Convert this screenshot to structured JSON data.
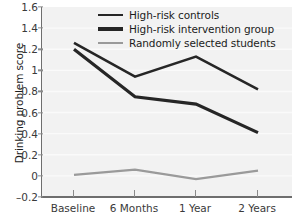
{
  "chart_data": {
    "type": "line",
    "title": "",
    "xlabel": "",
    "ylabel": "Drinking problem score",
    "categories": [
      "Baseline",
      "6 Months",
      "1 Year",
      "2 Years"
    ],
    "ylim": [
      -0.2,
      1.6
    ],
    "yticks": [
      "1.6",
      "1.4",
      "1.2",
      "1",
      "0.8",
      "0.6",
      "0.4",
      "0.2",
      "0",
      "–0.2"
    ],
    "ytick_values": [
      1.6,
      1.4,
      1.2,
      1.0,
      0.8,
      0.6,
      0.4,
      0.2,
      0,
      -0.2
    ],
    "grid": "horizontal-light",
    "legend_position": "top-center",
    "series": [
      {
        "name": "High-risk controls",
        "values": [
          1.26,
          0.94,
          1.13,
          0.82
        ],
        "color": "#262626",
        "width": 2.6
      },
      {
        "name": "High-risk intervention group",
        "values": [
          1.2,
          0.75,
          0.68,
          0.41
        ],
        "color": "#262626",
        "width": 3.2
      },
      {
        "name": "Randomly selected students",
        "values": [
          0.01,
          0.06,
          -0.03,
          0.05
        ],
        "color": "#9a9a9a",
        "width": 2.2
      }
    ]
  },
  "axis": {
    "y_title": "Drinking problem score"
  },
  "legend": {
    "items": [
      {
        "label": "High-risk controls"
      },
      {
        "label": "High-risk intervention group"
      },
      {
        "label": "Randomly selected students"
      }
    ]
  },
  "colors": {
    "plot_background": "#f2f2f2",
    "axis": "#6e6e6e",
    "tick_text": "#3a3a3a",
    "dark_series": "#262626",
    "gray_series": "#9a9a9a",
    "gridline": "#fafafa"
  }
}
